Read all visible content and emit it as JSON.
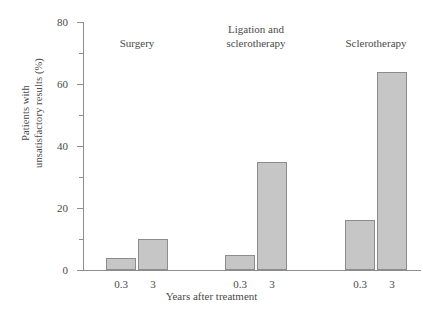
{
  "chart_data": {
    "type": "bar",
    "title": "",
    "xlabel": "Years after treatment",
    "ylabel_lines": [
      "Patients with",
      "unsatisfactory results (%)"
    ],
    "ylabel": "Patients with unsatisfactory results (%)",
    "ylim": [
      0,
      80
    ],
    "ytick_major": [
      0,
      20,
      40,
      60,
      80
    ],
    "ytick_minor": [
      10,
      30,
      50,
      70
    ],
    "grid": false,
    "legend": "none",
    "categories": [
      "0.3",
      "3",
      "0.3",
      "3",
      "0.3",
      "3"
    ],
    "values": [
      4,
      10,
      5,
      35,
      16,
      64
    ],
    "groups": [
      {
        "label_lines": [
          "Surgery"
        ],
        "bars": [
          {
            "x_label": "0.3",
            "value": 4
          },
          {
            "x_label": "3",
            "value": 10
          }
        ]
      },
      {
        "label_lines": [
          "Ligation and",
          "sclerotherapy"
        ],
        "bars": [
          {
            "x_label": "0.3",
            "value": 5
          },
          {
            "x_label": "3",
            "value": 35
          }
        ]
      },
      {
        "label_lines": [
          "Sclerotherapy"
        ],
        "bars": [
          {
            "x_label": "0.3",
            "value": 16
          },
          {
            "x_label": "3",
            "value": 64
          }
        ]
      }
    ],
    "colors": {
      "bar_fill": "#c6c6c6",
      "bar_stroke": "#8c8c8c",
      "axis": "#8e8e8e",
      "text": "#4a4a4a",
      "background": "#ffffff"
    }
  }
}
